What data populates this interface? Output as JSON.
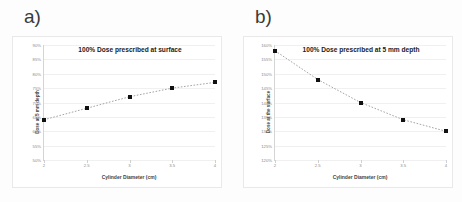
{
  "figure": {
    "background_color": "#fdfdfd",
    "marker_color": "#111111",
    "trendline_color": "#9a9a9a",
    "gridline_color": "#f0f0f0"
  },
  "panels": [
    {
      "panel_label": "a)",
      "chart_data": {
        "type": "scatter",
        "title": "100% Dose prescribed at surface",
        "xlabel": "Cylinder Diameter (cm)",
        "ylabel": "Dose at 5 mm depth",
        "x": [
          2,
          2.5,
          3,
          3.5,
          4
        ],
        "values": [
          64,
          68,
          72,
          75,
          77
        ],
        "xtick_labels": [
          "2",
          "2.5",
          "3",
          "3.5",
          "4"
        ],
        "ytick_labels": [
          "90%",
          "85%",
          "80%",
          "75%",
          "70%",
          "65%",
          "60%",
          "55%",
          "50%"
        ],
        "ytick_values": [
          90,
          85,
          80,
          75,
          70,
          65,
          60,
          55,
          50
        ],
        "xlim": [
          2,
          4
        ],
        "ylim": [
          50,
          90
        ],
        "grid": true,
        "legend": "none",
        "trendline": "dotted"
      }
    },
    {
      "panel_label": "b)",
      "chart_data": {
        "type": "scatter",
        "title": "100% Dose prescribed at 5 mm depth",
        "xlabel": "Cylinder Diameter (cm)",
        "ylabel": "Dose at the surface",
        "x": [
          2,
          2.5,
          3,
          3.5,
          4
        ],
        "values": [
          158,
          148,
          140,
          134,
          130
        ],
        "xtick_labels": [
          "2",
          "2.5",
          "3",
          "3.5",
          "4"
        ],
        "ytick_labels": [
          "160%",
          "155%",
          "150%",
          "145%",
          "140%",
          "135%",
          "130%",
          "125%",
          "120%"
        ],
        "ytick_values": [
          160,
          155,
          150,
          145,
          140,
          135,
          130,
          125,
          120
        ],
        "xlim": [
          2,
          4
        ],
        "ylim": [
          120,
          160
        ],
        "grid": true,
        "legend": "none",
        "trendline": "dotted"
      }
    }
  ]
}
